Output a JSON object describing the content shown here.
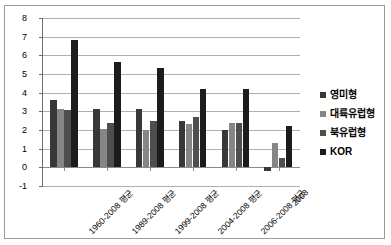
{
  "chart_data": {
    "type": "bar",
    "title": "",
    "subtitle": "",
    "xlabel": "",
    "ylabel": "",
    "ylim": [
      -1,
      8
    ],
    "ytick_step": 1,
    "yticks": [
      8,
      7,
      6,
      5,
      4,
      3,
      2,
      1,
      0,
      -1
    ],
    "grid": true,
    "legend_position": "right",
    "categories": [
      "1960-2008 평균",
      "1989-2008 평균",
      "1999-2008 평균",
      "2004-2008 평균",
      "2006-2008 평균",
      "2008"
    ],
    "series": [
      {
        "name": "영미형",
        "color": "#383838",
        "values": [
          3.6,
          3.15,
          3.1,
          2.5,
          2.0,
          -0.2
        ]
      },
      {
        "name": "대륙유럽형",
        "color": "#868686",
        "values": [
          3.1,
          2.05,
          2.0,
          2.3,
          2.4,
          1.3
        ]
      },
      {
        "name": "북유럽형",
        "color": "#4e4e4e",
        "values": [
          3.05,
          2.4,
          2.5,
          2.7,
          2.35,
          0.5
        ]
      },
      {
        "name": "KOR",
        "color": "#1c1c1c",
        "values": [
          6.8,
          5.65,
          5.3,
          4.2,
          4.2,
          2.2
        ]
      }
    ]
  },
  "legend": {
    "items": [
      {
        "label": "영미형",
        "color": "#383838"
      },
      {
        "label": "대륙유럽형",
        "color": "#868686"
      },
      {
        "label": "북유럽형",
        "color": "#4e4e4e"
      },
      {
        "label": "KOR",
        "color": "#1c1c1c"
      }
    ]
  },
  "frame": {
    "border_color": "#9a9a9a",
    "background": "#ffffff"
  }
}
